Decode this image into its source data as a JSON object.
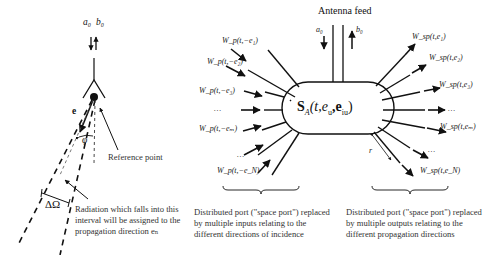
{
  "left_panel": {
    "symbols": {
      "a": "a₀",
      "b": "b₀",
      "e": "e",
      "phi": "φ",
      "delta_omega": "ΔΩ"
    },
    "labels": {
      "reference_point": "Reference point",
      "radiation_caption": [
        "Radiation which falls into this",
        "interval will be assigned to the",
        "propagation direction eₙ"
      ]
    }
  },
  "right_panel": {
    "antenna_feed": "Antenna feed",
    "feed_symbols": {
      "a": "a₀",
      "b": "b₀"
    },
    "central_block": "S_A (t, e_o, e_iu)",
    "central_block_display": {
      "S": "S",
      "sub": "A",
      "args": "(t,e",
      "sub2": "u",
      "comma": ",e",
      "sub3": "iu",
      "close": ")"
    },
    "inputs": [
      "W_p(t,−e₁)",
      "W_p(t,−e₂)",
      "W_p(t,−e₃)",
      "…",
      "W_p(t,−eₘ)",
      "…",
      "W_p(t,−e_N)"
    ],
    "outputs": [
      "W_sp(t,e₁)",
      "W_sp(t,e₂)",
      "W_sp(t,e₃)",
      "…",
      "W_sp(t,eₘ)",
      "…",
      "W_sp(t,e_N)"
    ],
    "r_label": "r",
    "caption_inputs": [
      "Distributed port (\"space port\") replaced",
      "by multiple  inputs relating to the",
      "different directions of incidence"
    ],
    "caption_outputs": [
      "Distributed port (\"space port\") replaced",
      "by multiple  outputs relating to the",
      "different propagation directions"
    ]
  }
}
